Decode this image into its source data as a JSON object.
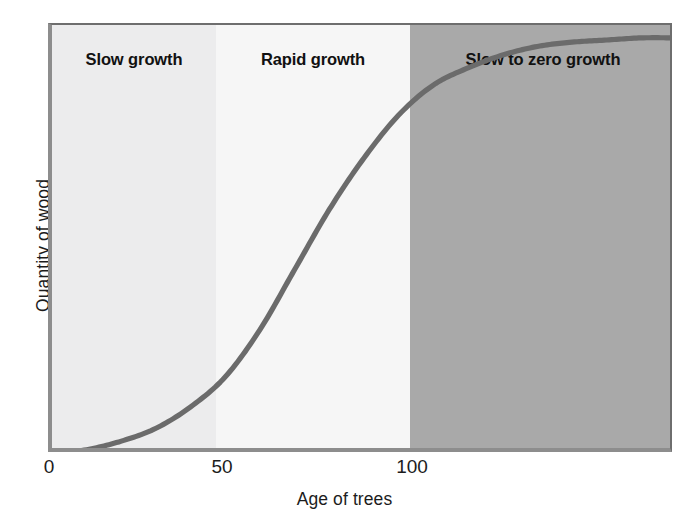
{
  "chart_data": {
    "type": "line",
    "title": "",
    "xlabel": "Age of trees",
    "ylabel": "Quantity of wood",
    "xlim": [
      0,
      180
    ],
    "ylim": [
      0,
      100
    ],
    "xticks": [
      "0",
      "50",
      "100"
    ],
    "xtick_values": [
      0,
      50,
      100
    ],
    "yticks": [],
    "grid": false,
    "legend": null,
    "series": [
      {
        "name": "Quantity of wood vs age of trees",
        "color": "#6b6b6b",
        "x": [
          0,
          10,
          20,
          30,
          40,
          50,
          60,
          70,
          80,
          90,
          100,
          110,
          120,
          130,
          140,
          150,
          160,
          170,
          180
        ],
        "y": [
          0,
          1,
          3,
          6,
          11,
          18,
          29,
          43,
          57,
          69,
          79,
          86,
          90,
          93,
          95,
          96,
          96.5,
          97,
          97
        ]
      }
    ],
    "annotations": [
      {
        "name": "slow-growth",
        "text": "Slow growth",
        "x_range": [
          0,
          47
        ],
        "band_color": "#ececed"
      },
      {
        "name": "rapid-growth",
        "text": "Rapid growth",
        "x_range": [
          47,
          103
        ],
        "band_color": "#f6f6f6"
      },
      {
        "name": "slow-to-zero-growth",
        "text": "Slow to zero growth",
        "x_range": [
          103,
          180
        ],
        "band_color": "#a9a9a9"
      }
    ]
  },
  "axes": {
    "y_title": "Quantity of wood",
    "x_title": "Age of trees",
    "x_tick_labels": [
      "0",
      "50",
      "100"
    ],
    "axis_color": "#8d8d8d",
    "curve_color": "#6b6b6b"
  },
  "bands": [
    {
      "id": "slow-growth",
      "label": "Slow growth",
      "color": "#ececed"
    },
    {
      "id": "rapid-growth",
      "label": "Rapid growth",
      "color": "#f6f6f6"
    },
    {
      "id": "slow-to-zero",
      "label": "Slow to zero growth",
      "color": "#a9a9a9"
    }
  ]
}
